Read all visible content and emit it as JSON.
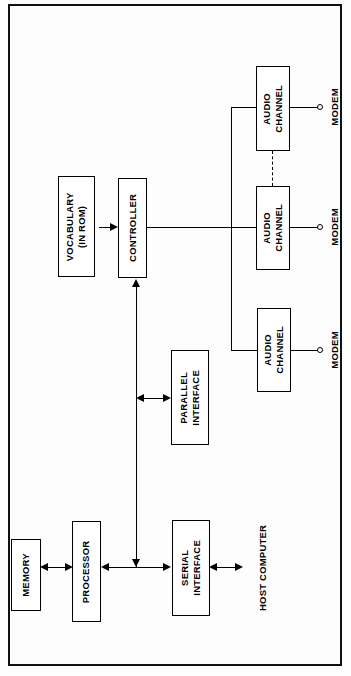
{
  "figure": {
    "type": "block-diagram",
    "orientation": "rotated-90-ccw",
    "border_color": "#111111",
    "line_color": "#000000",
    "background": "#fefefe"
  },
  "blocks": {
    "memory": {
      "line1": "MEMORY",
      "line2": ""
    },
    "processor": {
      "line1": "PROCESSOR",
      "line2": ""
    },
    "serial_interface": {
      "line1": "SERIAL",
      "line2": "INTERFACE"
    },
    "parallel_interface": {
      "line1": "PARALLEL",
      "line2": "INTERFACE"
    },
    "vocabulary": {
      "line1": "VOCABULARY",
      "line2": "(IN ROM)"
    },
    "controller": {
      "line1": "CONTROLLER",
      "line2": ""
    },
    "audio_channel_bottom": {
      "line1": "AUDIO",
      "line2": "CHANNEL"
    },
    "audio_channel_middle": {
      "line1": "AUDIO",
      "line2": "CHANNEL"
    },
    "audio_channel_top": {
      "line1": "AUDIO",
      "line2": "CHANNEL"
    }
  },
  "labels": {
    "host_computer": {
      "line1": "HOST",
      "line2": "COMPUTER"
    },
    "modem_bottom": "MODEM",
    "modem_middle": "MODEM",
    "modem_top": "MODEM"
  }
}
